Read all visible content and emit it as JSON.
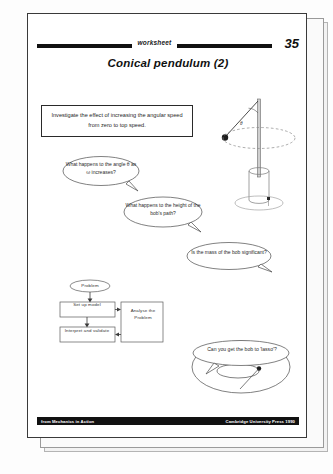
{
  "header": {
    "worksheet_label": "worksheet",
    "page_number": "35",
    "title": "Conical pendulum (2)"
  },
  "instruction": {
    "text": "Investigate the effect of increasing the angular speed from zero to top speed."
  },
  "diagram": {
    "angle_label": "θ",
    "name": "conical-pendulum-apparatus"
  },
  "bubbles": [
    {
      "id": "angle-question",
      "text": "What happens to the angle θ as ω increases?"
    },
    {
      "id": "height-question",
      "text": "What happens to the height of the bob's path?"
    },
    {
      "id": "mass-question",
      "text": "Is the mass of the bob significant?"
    },
    {
      "id": "lasso-question",
      "text": "Can you get the bob to 'lasso'?"
    }
  ],
  "flowchart": {
    "problem": "Problem",
    "set_up_model": "Set up model",
    "interpret_and_validate": "Interpret and validate",
    "analyse_the_problem": "Analyse the Problem"
  },
  "footer": {
    "left": "from Mechanics in Action",
    "right": "Cambridge University Press 1990"
  }
}
